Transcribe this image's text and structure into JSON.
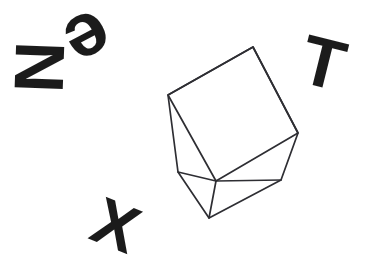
{
  "logo": {
    "wordmark": "NeXT",
    "style": "hand-drawn sketch",
    "background_color": "#ffffff",
    "letter_color": "#1b1b1b",
    "cube_stroke_color": "#2e2e33",
    "letters": [
      {
        "name": "letter-n",
        "char": "N",
        "rotation_deg": 92,
        "x": 14,
        "y": 32,
        "size_px": 70
      },
      {
        "name": "letter-e",
        "char": "e",
        "rotation_deg": 152,
        "x": 68,
        "y": 2,
        "size_px": 76
      },
      {
        "name": "letter-x",
        "char": "X",
        "rotation_deg": 22,
        "x": 94,
        "y": 192,
        "size_px": 66
      },
      {
        "name": "letter-t",
        "char": "T",
        "rotation_deg": 14,
        "x": 302,
        "y": 28,
        "size_px": 70
      }
    ],
    "cube": {
      "name": "isometric-cube",
      "vertices": {
        "top_apex": [
          253,
          47
        ],
        "left_upper": [
          168,
          95
        ],
        "right_upper": [
          298,
          133
        ],
        "front_center": [
          216,
          181
        ],
        "left_lower": [
          178,
          172
        ],
        "bottom_apex": [
          209,
          218
        ],
        "right_lower": [
          281,
          180
        ]
      },
      "faces": [
        "top",
        "left",
        "right"
      ],
      "outline_points": "253,47 168,95 178,172 209,218 281,180 298,133",
      "top_face_points": "168,95 253,47 298,133 216,181",
      "left_edge_points": "216,181 209,218",
      "bottom_left_points": "178,172 216,181",
      "bottom_right_points": "216,181 281,180"
    }
  }
}
